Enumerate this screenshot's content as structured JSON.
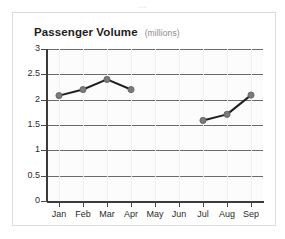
{
  "top_cut_text": "...",
  "card": {
    "title": "Passenger Volume",
    "subtitle": "(millions)"
  },
  "colors": {
    "title": "#1d1d1d",
    "subtitle": "#8a8a8a",
    "gridline": "#6b6b6b",
    "axis": "#3a3a3a",
    "line": "#1f1f1f",
    "marker_fill": "#7b7b7b",
    "marker_stroke": "#5d5d5d",
    "plot_background": "#fcfcfc",
    "card_border": "#dcdcdc"
  },
  "chart_data": {
    "type": "line",
    "title": "Passenger Volume",
    "subtitle": "(millions)",
    "xlabel": "",
    "ylabel": "",
    "categories": [
      "Jan",
      "Feb",
      "Mar",
      "Apr",
      "May",
      "Jun",
      "Jul",
      "Aug",
      "Sep"
    ],
    "values": [
      2.08,
      2.2,
      2.4,
      2.2,
      null,
      null,
      1.59,
      1.71,
      2.09
    ],
    "series": [
      {
        "name": "Passenger Volume",
        "values": [
          2.08,
          2.2,
          2.4,
          2.2,
          null,
          null,
          1.59,
          1.71,
          2.09
        ]
      }
    ],
    "ylim": [
      0,
      3
    ],
    "ytick_labels": [
      "3",
      "2.5",
      "2",
      "1.5",
      "1",
      "0.5",
      "0"
    ],
    "ytick_values": [
      3,
      2.5,
      2,
      1.5,
      1,
      0.5,
      0
    ],
    "grid": true,
    "grid_axis": "y",
    "legend": false,
    "markers": true,
    "gap_note": "No data plotted for May and Jun"
  }
}
